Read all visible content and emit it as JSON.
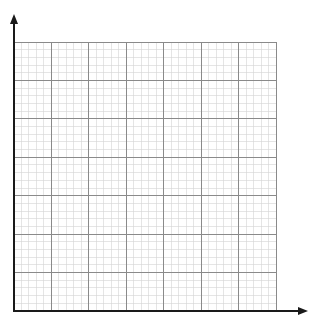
{
  "diagram": {
    "type": "blank-graph-paper",
    "canvas": {
      "width": 311,
      "height": 317
    },
    "grid": {
      "left": 14,
      "top": 42,
      "right": 276,
      "bottom": 311,
      "major_columns": 7,
      "major_rows": 7,
      "minor_per_major": 5,
      "major_color": "#8a8a8a",
      "minor_color": "#d4d4d4",
      "major_width": 1,
      "minor_width": 0.6
    },
    "axes": {
      "color": "#1a1a1a",
      "width": 2,
      "origin": {
        "x": 14,
        "y": 311
      },
      "y_axis": {
        "label": "",
        "arrow_tip_y": 14
      },
      "x_axis": {
        "label": "",
        "arrow_tip_x": 308
      }
    }
  }
}
